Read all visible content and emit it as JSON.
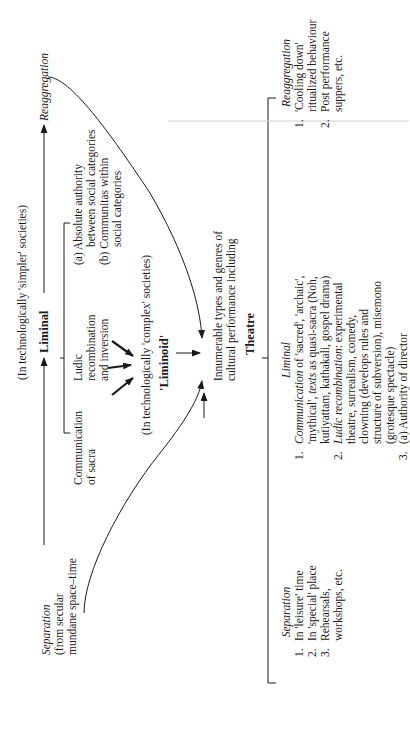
{
  "diagram": {
    "orientation": "rotated 90 degrees counter-clockwise",
    "simpler": {
      "label": "(In technologically 'simpler' societies)",
      "liminal": "Liminal",
      "communication": [
        "Communication",
        "of sacra"
      ],
      "ludic": [
        "Ludic",
        "recombination",
        "and inversion"
      ],
      "authority": {
        "a": "(a)  Absolute authority",
        "a2": "between social categories",
        "b": "(b)  Communitas within",
        "b2": "social categories"
      }
    },
    "complex": {
      "label": "(In technologically 'complex' societies)",
      "liminoid": "'Liminoid'"
    },
    "separation_left": {
      "title": "Separation",
      "line1": "(from secular",
      "line2": "mundane space–time"
    },
    "reaggregation_top": "Reaggregation",
    "innumerable": {
      "line1": "Innumerable types and genres of",
      "line2": "cultural performance including",
      "theatre": "Theatre"
    },
    "theatre_separation": {
      "title": "Separation",
      "items": [
        {
          "num": "1.",
          "text": "In 'leisure' time"
        },
        {
          "num": "2.",
          "text": "In 'special' place"
        },
        {
          "num": "3.",
          "text": "Rehearsals,",
          "cont": "workshops, etc."
        }
      ]
    },
    "theatre_liminal": {
      "title": "Liminal",
      "item1": {
        "num": "1.",
        "lead": "Communication",
        "rest": " of 'sacred', 'archaic',",
        "l2": "'mythical', ",
        "l2i": "texts",
        "l2r": " as quasi-sacra (Noh,",
        "l3": "kutiyattam, kathakali, gospel drama)"
      },
      "item2": {
        "num": "2.",
        "lead": "Ludic recombination",
        "rest": ": experimental",
        "l2": "theatre, surrealism, comedy,",
        "l3": "clowning (develops rules and",
        "l4": "structure of subversion), misemono",
        "l5": "(grotesque spectacle)"
      },
      "item3": {
        "num": "3.",
        "text": "(a)  Authority of director"
      }
    },
    "theatre_reaggregation": {
      "title": "Reaggregation",
      "items": [
        {
          "num": "1.",
          "text": "'Cooling down'",
          "cont": "ritualized behaviour"
        },
        {
          "num": "2.",
          "text": "Post performance",
          "cont": "suppers, etc."
        }
      ]
    }
  }
}
